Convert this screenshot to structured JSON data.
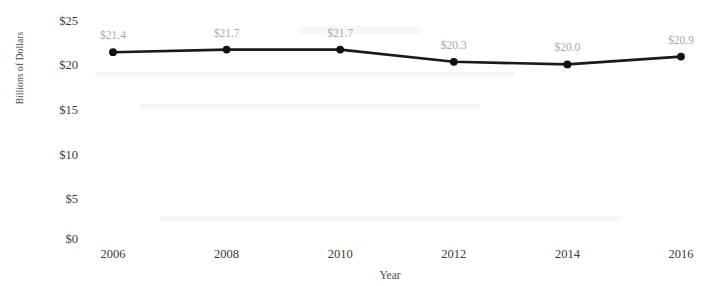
{
  "chart_data": {
    "type": "line",
    "title": "",
    "subtitle": "",
    "xlabel": "Year",
    "ylabel": "Billions of Dollars",
    "categories": [
      "2006",
      "2008",
      "2010",
      "2012",
      "2014",
      "2016"
    ],
    "x": [
      2006,
      2008,
      2010,
      2012,
      2014,
      2016
    ],
    "values": [
      21.4,
      21.7,
      21.7,
      20.3,
      20.0,
      20.9
    ],
    "point_labels": [
      "$21.4",
      "$21.7",
      "$21.7",
      "$20.3",
      "$20.0",
      "$20.9"
    ],
    "series": [
      {
        "name": "Billions of Dollars",
        "values": [
          21.4,
          21.7,
          21.7,
          20.3,
          20.0,
          20.9
        ]
      }
    ],
    "xlim": [
      2006,
      2016
    ],
    "ylim": [
      0,
      25
    ],
    "ytick_labels": [
      "$25",
      "$20",
      "$15",
      "$10",
      "$5",
      "$0"
    ],
    "ytick_values": [
      25,
      20,
      15,
      10,
      5,
      0
    ],
    "xtick_labels": [
      "2006",
      "2008",
      "2010",
      "2012",
      "2014",
      "2016"
    ],
    "grid": false,
    "legend": false,
    "legend_position": "none",
    "marker": "circle",
    "line_color": "#1a1a1a",
    "marker_color": "#111111",
    "label_color": "#a8a8a8",
    "tick_color": "#3a3a3a",
    "background_color": "#ffffff"
  },
  "axes": {
    "y_title": "Billions of Dollars",
    "x_title": "Year",
    "y_ticks": [
      {
        "label": "$25",
        "value": 25
      },
      {
        "label": "$20",
        "value": 20
      },
      {
        "label": "$15",
        "value": 15
      },
      {
        "label": "$10",
        "value": 10
      },
      {
        "label": "$5",
        "value": 5
      },
      {
        "label": "$0",
        "value": 0
      }
    ],
    "x_ticks": [
      {
        "label": "2006",
        "value": 2006
      },
      {
        "label": "2008",
        "value": 2008
      },
      {
        "label": "2010",
        "value": 2010
      },
      {
        "label": "2012",
        "value": 2012
      },
      {
        "label": "2014",
        "value": 2014
      },
      {
        "label": "2016",
        "value": 2016
      }
    ]
  },
  "points": [
    {
      "label": "$21.4",
      "x": 2006,
      "y": 21.4
    },
    {
      "label": "$21.7",
      "x": 2008,
      "y": 21.7
    },
    {
      "label": "$21.7",
      "x": 2010,
      "y": 21.7
    },
    {
      "label": "$20.3",
      "x": 2012,
      "y": 20.3
    },
    {
      "label": "$20.0",
      "x": 2014,
      "y": 20.0
    },
    {
      "label": "$20.9",
      "x": 2016,
      "y": 20.9
    }
  ]
}
